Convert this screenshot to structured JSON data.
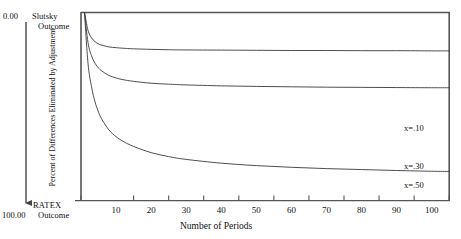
{
  "annotations": {
    "top_value": "0.00",
    "top_line1": "Slutsky",
    "top_line2": "Outcome",
    "bottom_value": "100.00",
    "bottom_line1": "RATEX",
    "bottom_line2": "Outcome"
  },
  "chart_data": {
    "type": "line",
    "title": "",
    "xlabel": "Number of Periods",
    "ylabel": "Percent of Differences Eliminated by Adjustment",
    "xlim": [
      0,
      105
    ],
    "ylim": [
      100,
      0
    ],
    "grid": false,
    "legend_position": "inline-right",
    "xticks": [
      10,
      20,
      30,
      40,
      50,
      60,
      70,
      80,
      90,
      100
    ],
    "xticklabels": [
      "10",
      "20",
      "30",
      "40",
      "50",
      "60",
      "70",
      "80",
      "90",
      "100"
    ],
    "yticks": [
      0,
      100
    ],
    "yticklabels": [
      "0.00",
      "100.00"
    ],
    "y_axis_note": "Inverted: 0.00 (Slutsky Outcome) at top, 100.00 (RATEX Outcome) at bottom",
    "series": [
      {
        "name": "x=.10",
        "label": "x=.10",
        "rate": 0.1,
        "color": "#3a3a3a",
        "x": [
          1,
          2,
          3,
          4,
          5,
          6,
          8,
          10,
          12,
          15,
          20,
          25,
          30,
          40,
          50,
          60,
          70,
          80,
          90,
          100,
          105
        ],
        "values": [
          100.0,
          73.0,
          60.5,
          52.5,
          47.0,
          43.0,
          37.5,
          34.0,
          31.5,
          28.8,
          25.5,
          23.4,
          21.9,
          19.9,
          18.6,
          17.7,
          17.0,
          16.5,
          16.0,
          15.6,
          15.5
        ]
      },
      {
        "name": "x=.30",
        "label": "x=.30",
        "rate": 0.3,
        "color": "#3a3a3a",
        "x": [
          1,
          2,
          3,
          4,
          5,
          6,
          8,
          10,
          12,
          15,
          20,
          25,
          30,
          40,
          50,
          60,
          70,
          80,
          90,
          100,
          105
        ],
        "values": [
          100.0,
          84.0,
          77.0,
          73.0,
          70.5,
          68.8,
          66.5,
          65.2,
          64.3,
          63.4,
          62.4,
          61.9,
          61.5,
          61.0,
          60.7,
          60.5,
          60.3,
          60.2,
          60.1,
          60.0,
          60.0
        ]
      },
      {
        "name": "x=.50",
        "label": "x=.50",
        "rate": 0.5,
        "color": "#3a3a3a",
        "x": [
          1,
          2,
          3,
          4,
          5,
          6,
          8,
          10,
          12,
          15,
          20,
          25,
          30,
          40,
          50,
          60,
          70,
          80,
          90,
          100,
          105
        ],
        "values": [
          100.0,
          90.5,
          86.5,
          84.5,
          83.3,
          82.6,
          81.7,
          81.3,
          81.0,
          80.7,
          80.4,
          80.2,
          80.1,
          80.0,
          79.9,
          79.8,
          79.8,
          79.7,
          79.7,
          79.6,
          79.6
        ]
      }
    ]
  },
  "colors": {
    "axis": "#555555",
    "curve": "#3a3a3a",
    "text": "#111111",
    "background": "#ffffff"
  }
}
